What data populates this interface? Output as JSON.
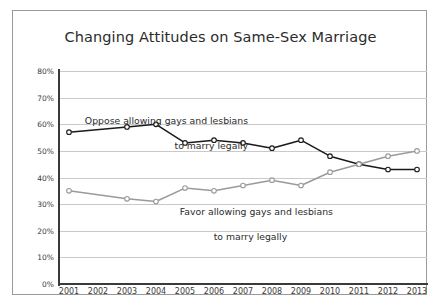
{
  "chart_data": {
    "type": "line",
    "title": "Changing Attitudes on Same-Sex Marriage",
    "xlabel": "",
    "ylabel": "",
    "grid": true,
    "legend_position": "inline-annotations",
    "x": [
      2001,
      2002,
      2003,
      2004,
      2005,
      2006,
      2007,
      2008,
      2009,
      2010,
      2011,
      2012,
      2013
    ],
    "xtick_labels": [
      "2001",
      "2002",
      "2003",
      "2004",
      "2005",
      "2006",
      "2007",
      "2008",
      "2009",
      "2010",
      "2011",
      "2012",
      "2013"
    ],
    "ytick_labels": [
      "0%",
      "10%",
      "20%",
      "30%",
      "40%",
      "50%",
      "60%",
      "70%",
      "80%"
    ],
    "ytick_values": [
      0,
      10,
      20,
      30,
      40,
      50,
      60,
      70,
      80
    ],
    "ylim": [
      0,
      80
    ],
    "series": [
      {
        "name": "Oppose allowing gays and lesbians to marry legally",
        "color": "#1a1a1a",
        "marker": "open-circle",
        "x": [
          2001,
          2003,
          2004,
          2005,
          2006,
          2007,
          2008,
          2009,
          2010,
          2011,
          2012,
          2013
        ],
        "values": [
          57,
          59,
          60,
          53,
          54,
          53,
          51,
          54,
          48,
          45,
          43,
          43
        ]
      },
      {
        "name": "Favor allowing gays and lesbians to marry legally",
        "color": "#9a9a9a",
        "marker": "open-circle",
        "x": [
          2001,
          2003,
          2004,
          2005,
          2006,
          2007,
          2008,
          2009,
          2010,
          2011,
          2012,
          2013
        ],
        "values": [
          35,
          32,
          31,
          36,
          35,
          37,
          39,
          37,
          42,
          45,
          48,
          50
        ]
      }
    ],
    "annotations": [
      {
        "id": "oppose",
        "line1": "Oppose allowing gays and lesbians",
        "line2": "to marry legally"
      },
      {
        "id": "favor",
        "line1": "Favor allowing gays and lesbians",
        "line2": "to marry legally"
      }
    ]
  }
}
